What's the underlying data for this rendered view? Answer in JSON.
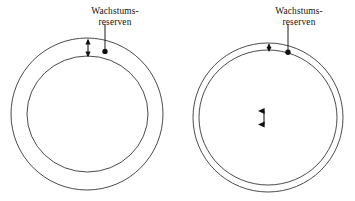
{
  "page": {
    "background_color": "#ffffff",
    "ink_color": "#1a1a1a",
    "cut_off_header_text": ""
  },
  "figures": [
    {
      "id": "left-figure",
      "name": "figure-large-growth-reserves",
      "label": {
        "line1": "Wachstums-",
        "line2": "reserven"
      },
      "outer_circle": {
        "cx": 87,
        "cy": 114,
        "rx": 76,
        "ry": 76
      },
      "inner_circle": {
        "cx": 87.5,
        "cy": 114,
        "rx": 60.5,
        "ry": 58
      },
      "gap_px": 16,
      "arrow": {
        "x": 88,
        "y_top": 39,
        "y_bottom": 57
      },
      "leader": {
        "x": 105,
        "y_top": 24,
        "y_bottom": 51,
        "dot_r": 2.6
      }
    },
    {
      "id": "right-figure",
      "name": "figure-small-growth-reserves",
      "label": {
        "line1": "Wachstums-",
        "line2": "reserven"
      },
      "outer_circle": {
        "cx": 268,
        "cy": 117.5,
        "rx": 75,
        "ry": 74.5
      },
      "inner_circle": {
        "cx": 268,
        "cy": 117.5,
        "rx": 69,
        "ry": 67.5
      },
      "gap_px": 6,
      "arrow": {
        "x": 269,
        "y_top": 44,
        "y_bottom": 51
      },
      "leader": {
        "x": 288,
        "y_top": 24,
        "y_bottom": 52,
        "dot_r": 2.6
      }
    }
  ]
}
